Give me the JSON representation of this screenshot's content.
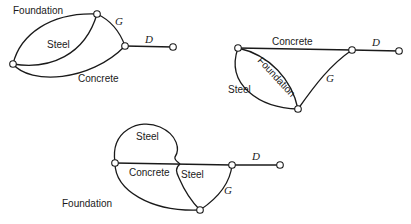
{
  "figure": {
    "diagrams": [
      {
        "id": "network-1",
        "labels": {
          "foundation": "Foundation",
          "steel": "Steel",
          "concrete": "Concrete",
          "g": "G",
          "d": "D"
        }
      },
      {
        "id": "network-2",
        "labels": {
          "concrete": "Concrete",
          "foundation": "Foundation",
          "steel": "Steel",
          "g": "G",
          "d": "D"
        }
      },
      {
        "id": "network-3",
        "labels": {
          "steel_loop": "Steel",
          "concrete": "Concrete",
          "steel": "Steel",
          "foundation": "Foundation",
          "g": "G",
          "d": "D"
        }
      }
    ]
  }
}
